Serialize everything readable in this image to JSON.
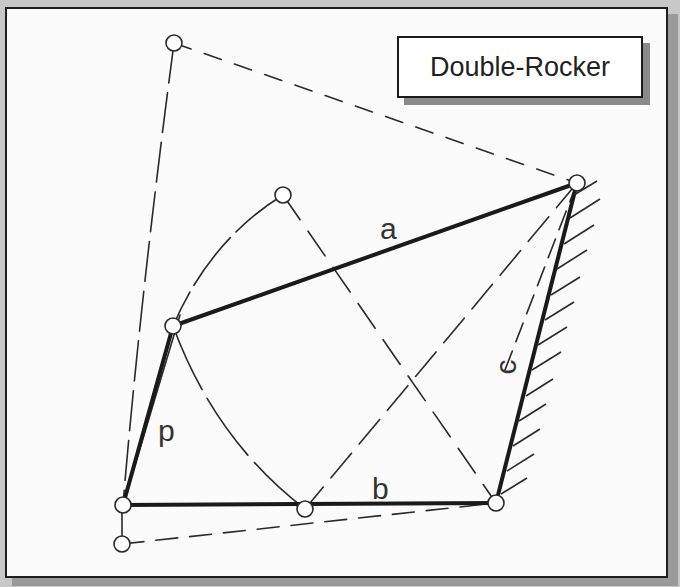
{
  "diagram": {
    "title": "Double-Rocker",
    "type": "four-bar linkage",
    "colors": {
      "background": "#fbfbfb",
      "frame": "#1e1e1e",
      "link": "#1a1a1a",
      "construction": "#2a2a2a",
      "shadow": "#9a9a9a"
    },
    "labels": {
      "a": "a",
      "b": "b",
      "c": "c",
      "d": "d"
    },
    "pivots": [
      {
        "id": "ground-left",
        "x": 123,
        "y": 505
      },
      {
        "id": "ground-right",
        "x": 496,
        "y": 503
      },
      {
        "id": "coupler-left",
        "x": 173,
        "y": 326
      },
      {
        "id": "coupler-right",
        "x": 577,
        "y": 183
      },
      {
        "id": "extreme-top-left",
        "x": 174,
        "y": 43
      },
      {
        "id": "mid-upper",
        "x": 283,
        "y": 195
      },
      {
        "id": "mid-lower",
        "x": 305,
        "y": 509
      },
      {
        "id": "extreme-bottom-left",
        "x": 122,
        "y": 544
      }
    ],
    "links": [
      {
        "name": "a",
        "from": "coupler-left",
        "to": "coupler-right",
        "style": "solid-thick"
      },
      {
        "name": "b",
        "from": "ground-left",
        "to": "ground-right",
        "style": "solid-thick"
      },
      {
        "name": "c",
        "from": "ground-right",
        "to": "coupler-right",
        "style": "solid-thick"
      },
      {
        "name": "d",
        "from": "ground-left",
        "to": "coupler-left",
        "style": "solid-thick"
      }
    ],
    "hatch_count": 13
  }
}
